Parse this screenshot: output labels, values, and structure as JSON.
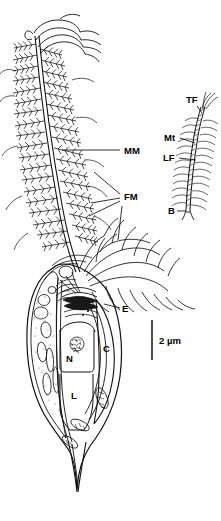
{
  "figure": {
    "background_color": "#ffffff",
    "ink_color": "#111111"
  },
  "labels": {
    "mastigoneme_flagellum": "MM",
    "flagellar_mastigonemes": "FM",
    "eyespot": "E",
    "nucleus": "N",
    "chloroplast": "C",
    "lipid_body": "L"
  },
  "inset": {
    "terminal_filament": "TF",
    "microtubular_shaft": "Mt",
    "lateral_filaments": "LF",
    "base": "B"
  },
  "scale": {
    "value": "2 µm"
  }
}
